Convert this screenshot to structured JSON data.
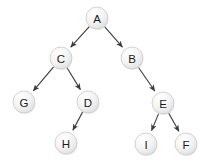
{
  "diagram": {
    "type": "binary-tree",
    "background_color": "#ffffff",
    "width": 210,
    "height": 167,
    "node_radius": 11,
    "node_fill_light": "#fcfcfc",
    "node_fill_dark": "#e4e4e4",
    "node_stroke_color": "#c9c9c9",
    "edge_color": "#3b3b3b",
    "label_color": "#1a1a1a",
    "root": "A",
    "nodes": [
      {
        "id": "A",
        "label": "A",
        "x": 97,
        "y": 18,
        "level": 0
      },
      {
        "id": "C",
        "label": "C",
        "x": 61,
        "y": 58,
        "level": 1
      },
      {
        "id": "B",
        "label": "B",
        "x": 132,
        "y": 58,
        "level": 1
      },
      {
        "id": "G",
        "label": "G",
        "x": 24,
        "y": 102,
        "level": 2
      },
      {
        "id": "D",
        "label": "D",
        "x": 88,
        "y": 102,
        "level": 2
      },
      {
        "id": "E",
        "label": "E",
        "x": 163,
        "y": 103,
        "level": 2
      },
      {
        "id": "H",
        "label": "H",
        "x": 66,
        "y": 143,
        "level": 3
      },
      {
        "id": "I",
        "label": "I",
        "x": 146,
        "y": 144,
        "level": 3
      },
      {
        "id": "F",
        "label": "F",
        "x": 186,
        "y": 144,
        "level": 3
      }
    ],
    "edges": [
      {
        "from": "A",
        "to": "C",
        "directed": true,
        "side": "left"
      },
      {
        "from": "A",
        "to": "B",
        "directed": true,
        "side": "right"
      },
      {
        "from": "C",
        "to": "G",
        "directed": true,
        "side": "left"
      },
      {
        "from": "C",
        "to": "D",
        "directed": true,
        "side": "right"
      },
      {
        "from": "D",
        "to": "H",
        "directed": true,
        "side": "left"
      },
      {
        "from": "B",
        "to": "E",
        "directed": true,
        "side": "right"
      },
      {
        "from": "E",
        "to": "I",
        "directed": true,
        "side": "left"
      },
      {
        "from": "E",
        "to": "F",
        "directed": true,
        "side": "right"
      }
    ]
  }
}
